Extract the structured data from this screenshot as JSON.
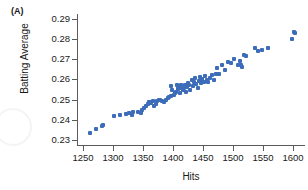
{
  "panel": {
    "label": "(A)"
  },
  "colors": {
    "marker": "#3d6cb8",
    "axis": "#5a5a5a",
    "text": "#1a1a1a",
    "background": "#ffffff"
  },
  "chart_data": {
    "type": "scatter",
    "title": "",
    "panel_label": "(A)",
    "xlabel": "Hits",
    "ylabel": "Batting Average",
    "xlim": [
      1240,
      1620
    ],
    "ylim": [
      0.2275,
      0.2925
    ],
    "xticks": [
      1250,
      1300,
      1350,
      1400,
      1450,
      1500,
      1550,
      1600
    ],
    "xtick_labels": [
      "1250",
      "1300",
      "1350",
      "1400",
      "1450",
      "1500",
      "1550",
      "1600"
    ],
    "yticks": [
      0.23,
      0.24,
      0.25,
      0.26,
      0.27,
      0.28,
      0.29
    ],
    "ytick_labels": [
      "0.23",
      "0.24",
      "0.25",
      "0.26",
      "0.27",
      "0.28",
      "0.29"
    ],
    "grid": false,
    "legend": null,
    "marker_color": "#3d6cb8",
    "marker_shape": "square",
    "points": [
      [
        1262,
        0.2335
      ],
      [
        1272,
        0.2355
      ],
      [
        1281,
        0.237
      ],
      [
        1284,
        0.2372
      ],
      [
        1302,
        0.242
      ],
      [
        1312,
        0.2422
      ],
      [
        1322,
        0.2428
      ],
      [
        1326,
        0.2432
      ],
      [
        1331,
        0.2425
      ],
      [
        1334,
        0.2437
      ],
      [
        1341,
        0.244
      ],
      [
        1346,
        0.2432
      ],
      [
        1349,
        0.245
      ],
      [
        1352,
        0.246
      ],
      [
        1355,
        0.247
      ],
      [
        1358,
        0.2478
      ],
      [
        1360,
        0.2486
      ],
      [
        1362,
        0.249
      ],
      [
        1364,
        0.2482
      ],
      [
        1366,
        0.2492
      ],
      [
        1369,
        0.247
      ],
      [
        1372,
        0.2478
      ],
      [
        1374,
        0.2495
      ],
      [
        1377,
        0.25
      ],
      [
        1379,
        0.2497
      ],
      [
        1382,
        0.2492
      ],
      [
        1385,
        0.2488
      ],
      [
        1388,
        0.25
      ],
      [
        1391,
        0.2508
      ],
      [
        1393,
        0.2515
      ],
      [
        1396,
        0.252
      ],
      [
        1397,
        0.257
      ],
      [
        1399,
        0.2548
      ],
      [
        1401,
        0.2525
      ],
      [
        1403,
        0.2533
      ],
      [
        1405,
        0.254
      ],
      [
        1406,
        0.2572
      ],
      [
        1408,
        0.2555
      ],
      [
        1409,
        0.2568
      ],
      [
        1411,
        0.2535
      ],
      [
        1412,
        0.256
      ],
      [
        1414,
        0.2575
      ],
      [
        1416,
        0.2548
      ],
      [
        1418,
        0.2558
      ],
      [
        1420,
        0.2572
      ],
      [
        1421,
        0.254
      ],
      [
        1423,
        0.2562
      ],
      [
        1425,
        0.2585
      ],
      [
        1427,
        0.2575
      ],
      [
        1429,
        0.255
      ],
      [
        1431,
        0.26
      ],
      [
        1433,
        0.2568
      ],
      [
        1435,
        0.259
      ],
      [
        1437,
        0.2608
      ],
      [
        1439,
        0.258
      ],
      [
        1441,
        0.256
      ],
      [
        1443,
        0.2592
      ],
      [
        1445,
        0.2612
      ],
      [
        1447,
        0.2582
      ],
      [
        1449,
        0.2602
      ],
      [
        1451,
        0.259
      ],
      [
        1454,
        0.2618
      ],
      [
        1457,
        0.26
      ],
      [
        1459,
        0.2588
      ],
      [
        1462,
        0.2608
      ],
      [
        1465,
        0.2622
      ],
      [
        1468,
        0.26
      ],
      [
        1471,
        0.2625
      ],
      [
        1474,
        0.2655
      ],
      [
        1477,
        0.2628
      ],
      [
        1481,
        0.267
      ],
      [
        1486,
        0.2645
      ],
      [
        1492,
        0.2688
      ],
      [
        1497,
        0.268
      ],
      [
        1502,
        0.27
      ],
      [
        1508,
        0.2672
      ],
      [
        1511,
        0.269
      ],
      [
        1513,
        0.2672
      ],
      [
        1515,
        0.2662
      ],
      [
        1518,
        0.2722
      ],
      [
        1521,
        0.2718
      ],
      [
        1537,
        0.2758
      ],
      [
        1541,
        0.2742
      ],
      [
        1549,
        0.2745
      ],
      [
        1558,
        0.2755
      ],
      [
        1598,
        0.2802
      ],
      [
        1601,
        0.2838
      ],
      [
        1603,
        0.2832
      ]
    ]
  }
}
